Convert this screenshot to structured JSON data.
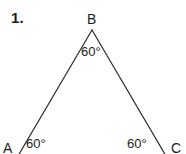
{
  "figure": {
    "problem_number": "1.",
    "shape": "triangle",
    "stroke_color": "#2b2b2b",
    "background_color": "#ffffff",
    "text_color": "#1c1c1c",
    "vertices": [
      {
        "name": "A",
        "label": "A",
        "x": 18,
        "y": 154
      },
      {
        "name": "B",
        "label": "B",
        "x": 92,
        "y": 30
      },
      {
        "name": "C",
        "label": "C",
        "x": 166,
        "y": 154
      }
    ],
    "angles": [
      {
        "at": "A",
        "label": "60°"
      },
      {
        "at": "B",
        "label": "60°"
      },
      {
        "at": "C",
        "label": "60°"
      }
    ],
    "sides": [
      {
        "from": "A",
        "to": "B"
      },
      {
        "from": "B",
        "to": "C"
      }
    ]
  }
}
